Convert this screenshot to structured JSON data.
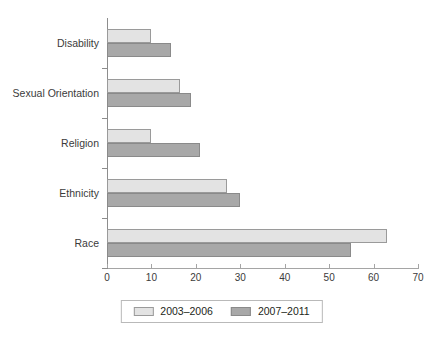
{
  "chart_data": {
    "type": "bar",
    "orientation": "horizontal",
    "title": "",
    "xlabel": "",
    "ylabel": "",
    "xlim": [
      0,
      70
    ],
    "xticks": [
      0,
      10,
      20,
      30,
      40,
      50,
      60,
      70
    ],
    "xtick_labels": [
      "0",
      "10",
      "20",
      "30",
      "40",
      "50",
      "60",
      "70"
    ],
    "grid": false,
    "legend_position": "bottom-center",
    "categories": [
      "Disability",
      "Sexual Orientation",
      "Religion",
      "Ethnicity",
      "Race"
    ],
    "series": [
      {
        "name": "2003–2006",
        "color": "#e3e3e3",
        "values": [
          10,
          16.4,
          10,
          27,
          63
        ]
      },
      {
        "name": "2007–2011",
        "color": "#a8a8a8",
        "values": [
          14.5,
          18.9,
          21,
          30,
          55
        ]
      }
    ]
  },
  "legend": {
    "items": [
      {
        "label": "2003–2006",
        "swatch": "series-a"
      },
      {
        "label": "2007–2011",
        "swatch": "series-b"
      }
    ]
  }
}
